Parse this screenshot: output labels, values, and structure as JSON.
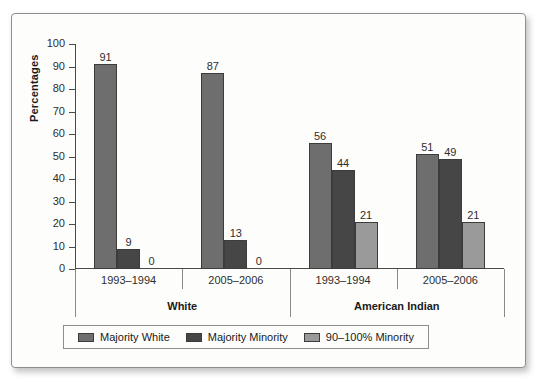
{
  "chart_data": {
    "type": "bar",
    "title": "",
    "subtitle": "",
    "xlabel": "",
    "ylabel": "Percentages",
    "ylim": [
      0,
      100
    ],
    "ytick_step": 10,
    "yticks": [
      100,
      90,
      80,
      70,
      60,
      50,
      40,
      30,
      20,
      10,
      0
    ],
    "grid": false,
    "legend_position": "bottom",
    "group_labels": [
      "White",
      "American Indian"
    ],
    "categories": [
      "1993–1994",
      "2005–2006",
      "1993–1994",
      "2005–2006"
    ],
    "category_groups": [
      "White",
      "White",
      "American Indian",
      "American Indian"
    ],
    "series": [
      {
        "name": "Majority White",
        "color": "#6e6e6e",
        "values": [
          91,
          87,
          56,
          51
        ]
      },
      {
        "name": "Majority Minority",
        "color": "#464646",
        "values": [
          9,
          13,
          44,
          49
        ]
      },
      {
        "name": "90–100% Minority",
        "color": "#9a9a9a",
        "values": [
          0,
          0,
          21,
          21
        ]
      }
    ]
  },
  "legend": {
    "items": [
      {
        "label": "Majority White",
        "swatch_name": "legend-swatch-majority-white"
      },
      {
        "label": "Majority Minority",
        "swatch_name": "legend-swatch-majority-minority"
      },
      {
        "label": "90–100% Minority",
        "swatch_name": "legend-swatch-90-100-minority"
      }
    ]
  },
  "colors": {
    "majority_white": "#6e6e6e",
    "majority_minority": "#464646",
    "minority_90_100": "#9a9a9a",
    "axis": "#4a4a4a",
    "frame": "#8e8e8e",
    "background": "#fdfdfc",
    "text": "#2d2d2d"
  }
}
